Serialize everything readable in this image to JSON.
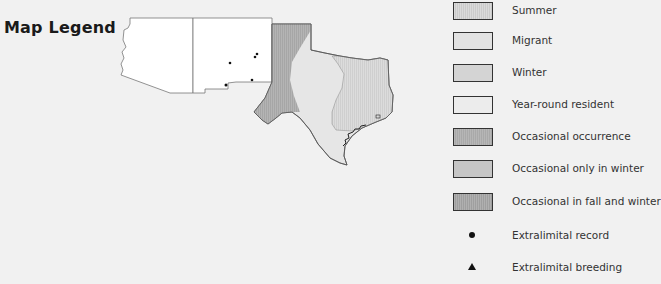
{
  "title": "Map Legend",
  "colors": {
    "background": "#f1f1f1",
    "summer": "#d6d6d6",
    "migrant": "#e2e2e2",
    "winter": "#d4d4d4",
    "year_round_resident": "#ececec",
    "occasional_occurrence": "#b2b2b2",
    "occasional_only_in_winter": "#c6c6c6",
    "occasional_in_fall_and_winter": "#ababab",
    "non_range": "#ffffff"
  },
  "map": {
    "regions": [
      "Arizona",
      "New Mexico",
      "Texas"
    ],
    "extralimital_records": 5
  },
  "legend": {
    "items": [
      {
        "label": "Summer",
        "type": "swatch",
        "key": "summer"
      },
      {
        "label": "Migrant",
        "type": "swatch",
        "key": "migrant"
      },
      {
        "label": "Winter",
        "type": "swatch",
        "key": "winter"
      },
      {
        "label": "Year-round resident",
        "type": "swatch",
        "key": "year_round_resident"
      },
      {
        "label": "Occasional occurrence",
        "type": "swatch",
        "key": "occasional_occurrence"
      },
      {
        "label": "Occasional only in winter",
        "type": "swatch",
        "key": "occasional_only_in_winter"
      },
      {
        "label": "Occasional in fall and winter",
        "type": "swatch",
        "key": "occasional_in_fall_and_winter"
      },
      {
        "label": "Extralimital record",
        "type": "dot"
      },
      {
        "label": "Extralimital breeding",
        "type": "triangle"
      }
    ]
  }
}
